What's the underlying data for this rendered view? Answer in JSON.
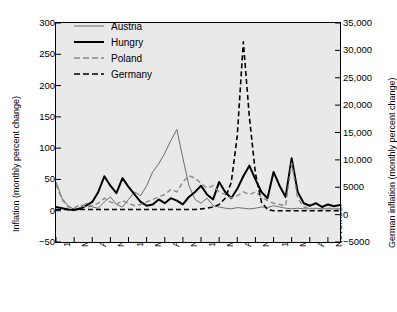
{
  "chart_data": {
    "type": "line",
    "title": "",
    "xlabel": "",
    "ylabel": "Inflation (monthly percent change)",
    "y2label": "German inflation (monthly percent change)",
    "ylim": [
      -50,
      300
    ],
    "y2lim": [
      -5000,
      35000
    ],
    "grid": false,
    "legend_position": "top-center",
    "yticks": [
      "300",
      "250",
      "200",
      "150",
      "100",
      "50",
      "0",
      "-50"
    ],
    "ytick_values": [
      300,
      250,
      200,
      150,
      100,
      50,
      0,
      -50
    ],
    "y2ticks": [
      "35,000",
      "30,000",
      "25,000",
      "20,000",
      "15,000",
      "10,000",
      "5000",
      "0",
      "-5000"
    ],
    "y2tick_values": [
      35000,
      30000,
      25000,
      20000,
      15000,
      10000,
      5000,
      0,
      -5000
    ],
    "xticks": [
      "1921",
      "May",
      "August",
      "November",
      "1922",
      "May",
      "August",
      "November",
      "1923",
      "May",
      "August",
      "November",
      "1924",
      "May",
      "August",
      "November"
    ],
    "x_index_of_ticks": [
      0,
      3,
      6,
      9,
      12,
      15,
      18,
      21,
      24,
      27,
      30,
      33,
      36,
      39,
      42,
      45
    ],
    "x_count": 48,
    "series": [
      {
        "name": "Austria",
        "color": "#6e6e6e",
        "style": "solid",
        "width": 1,
        "axis": "left",
        "values": [
          46,
          20,
          8,
          2,
          5,
          12,
          6,
          4,
          14,
          22,
          10,
          6,
          18,
          30,
          24,
          40,
          62,
          75,
          92,
          112,
          130,
          84,
          40,
          18,
          12,
          20,
          8,
          6,
          4,
          3,
          5,
          4,
          3,
          4,
          6,
          5,
          8,
          6,
          4,
          3,
          4,
          3,
          3,
          4,
          3,
          3,
          3,
          3
        ]
      },
      {
        "name": "Hungry",
        "color": "#000000",
        "style": "solid",
        "width": 2,
        "axis": "left",
        "values": [
          6,
          4,
          2,
          1,
          3,
          8,
          14,
          30,
          55,
          40,
          28,
          52,
          38,
          26,
          14,
          8,
          10,
          18,
          12,
          20,
          16,
          10,
          22,
          30,
          40,
          26,
          18,
          46,
          30,
          20,
          35,
          55,
          72,
          50,
          30,
          20,
          62,
          40,
          22,
          84,
          30,
          12,
          8,
          12,
          6,
          10,
          7,
          9
        ]
      },
      {
        "name": "Poland",
        "color": "#8a8a8a",
        "style": "dashed",
        "width": 1.4,
        "axis": "left",
        "values": [
          42,
          18,
          6,
          4,
          10,
          5,
          8,
          12,
          20,
          14,
          10,
          16,
          12,
          8,
          10,
          14,
          18,
          22,
          26,
          34,
          30,
          46,
          56,
          52,
          44,
          36,
          40,
          30,
          26,
          20,
          24,
          30,
          26,
          30,
          22,
          16,
          12,
          10,
          8,
          76,
          20,
          6,
          4,
          3,
          3,
          4,
          3,
          3
        ]
      },
      {
        "name": "Germany",
        "color": "#000000",
        "style": "dashed",
        "width": 1.6,
        "axis": "right",
        "values_left_scale": [
          2,
          2,
          2,
          2,
          2,
          2,
          2,
          2,
          2,
          2,
          2,
          2,
          2,
          2,
          2,
          2,
          2,
          2,
          2,
          2,
          2,
          2,
          2,
          2,
          3,
          4,
          6,
          10,
          20,
          45,
          120,
          270,
          150,
          60,
          14,
          2,
          0,
          0,
          0,
          0,
          0,
          0,
          0,
          0,
          0,
          0,
          0,
          0
        ],
        "values": [
          200,
          200,
          200,
          200,
          200,
          200,
          200,
          200,
          200,
          200,
          200,
          200,
          200,
          200,
          200,
          200,
          200,
          200,
          200,
          200,
          200,
          200,
          200,
          200,
          340,
          460,
          690,
          1140,
          2290,
          5150,
          13700,
          30850,
          17150,
          6860,
          1600,
          230,
          0,
          0,
          0,
          0,
          0,
          0,
          0,
          0,
          0,
          0,
          0,
          0
        ]
      }
    ]
  },
  "legend": {
    "items": [
      {
        "label": "Austria"
      },
      {
        "label": "Hungry"
      },
      {
        "label": "Poland"
      },
      {
        "label": "Germany"
      }
    ]
  }
}
